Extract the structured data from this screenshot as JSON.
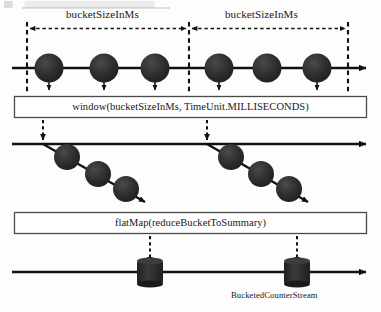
{
  "diagram": {
    "title_fragment": "",
    "buckets": [
      {
        "id": "bucket-1",
        "label": "bucketSizeInMs"
      },
      {
        "id": "bucket-2",
        "label": "bucketSizeInMs"
      }
    ],
    "operators": [
      {
        "id": "window-operator",
        "label": "window(bucketSizeInMs, TimeUnit.MILLISECONDS)"
      },
      {
        "id": "flatmap-operator",
        "label": "flatMap(reduceBucketToSummary)"
      }
    ],
    "output_stream": {
      "id": "bucketed-counter-stream",
      "label": "BucketedCounterStream"
    },
    "colors": {
      "ink": "#111111",
      "marble": "#2b2b2b",
      "box_border": "#444444",
      "box_fill": "#ffffff",
      "background": "#fdfdfc"
    },
    "timelines": [
      {
        "id": "source-timeline",
        "y": 68,
        "x_start": 12,
        "x_end": 372,
        "marbles": [
          {
            "cx": 49,
            "cy": 68,
            "r": 14.5,
            "has_emit_arrow": true,
            "arrow_to_y": 93
          },
          {
            "cx": 104,
            "cy": 68,
            "r": 14.5,
            "has_emit_arrow": true,
            "arrow_to_y": 93
          },
          {
            "cx": 155,
            "cy": 68,
            "r": 14.5,
            "has_emit_arrow": true,
            "arrow_to_y": 93
          },
          {
            "cx": 219,
            "cy": 68,
            "r": 14.5,
            "has_emit_arrow": true,
            "arrow_to_y": 93
          },
          {
            "cx": 267,
            "cy": 68,
            "r": 14.5,
            "has_emit_arrow": false,
            "arrow_to_y": 93
          },
          {
            "cx": 317,
            "cy": 68,
            "r": 14.5,
            "has_emit_arrow": true,
            "arrow_to_y": 93
          }
        ]
      },
      {
        "id": "windowed-timeline",
        "y": 144,
        "x_start": 12,
        "x_end": 372,
        "branches": [
          {
            "id": "window-branch-1",
            "from_x": 43,
            "from_y": 144,
            "to_x": 150,
            "to_y": 204,
            "marbles": [
              {
                "cx": 67,
                "cy": 157,
                "r": 13
              },
              {
                "cx": 98,
                "cy": 174,
                "r": 13
              },
              {
                "cx": 126,
                "cy": 189,
                "r": 13
              }
            ]
          },
          {
            "id": "window-branch-2",
            "from_x": 207,
            "from_y": 144,
            "to_x": 312,
            "to_y": 204,
            "marbles": [
              {
                "cx": 231,
                "cy": 157,
                "r": 13
              },
              {
                "cx": 261,
                "cy": 174,
                "r": 13
              },
              {
                "cx": 289,
                "cy": 189,
                "r": 13
              }
            ]
          }
        ]
      },
      {
        "id": "output-timeline",
        "y": 272,
        "x_start": 12,
        "x_end": 372,
        "buckets_out": [
          {
            "id": "summary-bucket-1",
            "cx": 150,
            "cy": 272,
            "w": 26,
            "h": 24
          },
          {
            "id": "summary-bucket-2",
            "cx": 297,
            "cy": 272,
            "w": 26,
            "h": 24
          }
        ]
      }
    ],
    "bucket_boundaries": [
      {
        "id": "boundary-left",
        "x": 27,
        "y1": 22,
        "y2": 93
      },
      {
        "id": "boundary-middle",
        "x": 189,
        "y1": 22,
        "y2": 93
      },
      {
        "id": "boundary-right",
        "x": 348,
        "y1": 22,
        "y2": 93
      }
    ],
    "span_arrows": [
      {
        "id": "span-arrow-1",
        "x1": 29,
        "x2": 187,
        "y": 28,
        "label_x": 70,
        "label_y": 14
      },
      {
        "id": "span-arrow-2",
        "x1": 191,
        "x2": 346,
        "y": 28,
        "label_x": 228,
        "label_y": 14
      }
    ],
    "connectors": [
      {
        "id": "window-connector-1",
        "x": 43,
        "y1": 92,
        "y2": 142,
        "style": "dashed"
      },
      {
        "id": "window-connector-2",
        "x": 207,
        "y1": 92,
        "y2": 142,
        "style": "dashed"
      },
      {
        "id": "flatmap-connector-1",
        "x": 150,
        "y1": 236,
        "y2": 268,
        "style": "dashed"
      },
      {
        "id": "flatmap-connector-2",
        "x": 297,
        "y1": 236,
        "y2": 268,
        "style": "dashed"
      }
    ],
    "boxes": [
      {
        "id": "window-box",
        "x": 14,
        "y": 96,
        "w": 353,
        "h": 22
      },
      {
        "id": "flatmap-box",
        "x": 14,
        "y": 212,
        "w": 353,
        "h": 22
      }
    ]
  }
}
